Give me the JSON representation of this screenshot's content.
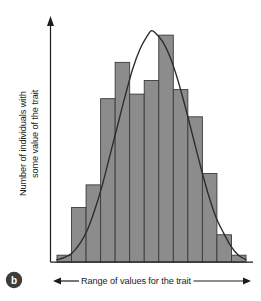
{
  "figure": {
    "panel_letter": "b",
    "panel_letter_shape": "filled-circle-badge"
  },
  "axes": {
    "y_label_line1": "Number of individuals with",
    "y_label_line2": "some value of the trait",
    "x_label": "Range of values for the trait",
    "y_axis_arrow": "arrow-up",
    "x_axis_arrow_left": "arrow-left",
    "x_axis_arrow_right": "arrow-right"
  },
  "colors": {
    "bar_fill": "#8c8c8c",
    "bar_stroke": "#3a3a3a",
    "curve_stroke": "#2b2b2b",
    "axis_stroke": "#1c1c1c",
    "background": "#ffffff",
    "badge_fill": "#3c3c3c",
    "badge_text": "#ffffff"
  },
  "chart_data": {
    "type": "bar",
    "title": "",
    "xlabel": "Range of values for the trait",
    "ylabel": "Number of individuals with some value of the trait",
    "grid": false,
    "legend": "none",
    "axis_tick_labels": false,
    "note": "Histogram of a continuously varying (polygenic) trait with an idealized normal distribution curve superimposed. Axes are unlabeled/qualitative; values are relative bar heights read off the plot as a fraction of the tallest bar.",
    "categories": [
      "1",
      "2",
      "3",
      "4",
      "5",
      "6",
      "7",
      "8",
      "9",
      "10",
      "11",
      "12",
      "13"
    ],
    "values": [
      3,
      24,
      34,
      72,
      88,
      74,
      80,
      100,
      76,
      64,
      39,
      12,
      3
    ],
    "ylim": [
      0,
      108
    ],
    "overlay_curve": {
      "type": "line",
      "name": "normal distribution curve",
      "x": [
        0,
        0.04,
        0.08,
        0.12,
        0.16,
        0.2,
        0.24,
        0.28,
        0.32,
        0.36,
        0.4,
        0.44,
        0.48,
        0.5,
        0.52,
        0.56,
        0.6,
        0.64,
        0.68,
        0.72,
        0.76,
        0.8,
        0.84,
        0.88,
        0.92,
        0.96,
        1.0
      ],
      "y": [
        1,
        2,
        4,
        8,
        14,
        23,
        34,
        47,
        60,
        73,
        85,
        94,
        100,
        102,
        101,
        97,
        90,
        80,
        68,
        55,
        42,
        30,
        20,
        13,
        7,
        3,
        1
      ]
    }
  }
}
